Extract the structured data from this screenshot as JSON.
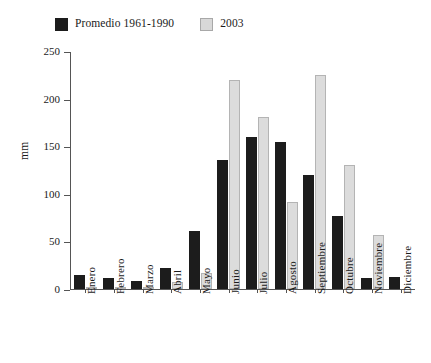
{
  "chart_data": {
    "type": "bar",
    "title": "",
    "xlabel": "",
    "ylabel": "mm",
    "ylim": [
      0,
      250
    ],
    "yticks": [
      0,
      50,
      100,
      150,
      200,
      250
    ],
    "grid": false,
    "legend_position": "top-left",
    "categories": [
      "Enero",
      "Febrero",
      "Marzo",
      "Abril",
      "Mayo",
      "Junio",
      "Julio",
      "Agosto",
      "Septiembre",
      "Octubre",
      "Noviembre",
      "Diciembre"
    ],
    "series": [
      {
        "name": "Promedio 1961-1990",
        "color": "#1c1c1c",
        "values": [
          15,
          12,
          8,
          22,
          61,
          136,
          160,
          155,
          120,
          77,
          12,
          13
        ]
      },
      {
        "name": "2003",
        "color": "#dcdcdc",
        "values": [
          2,
          1,
          1,
          7,
          17,
          220,
          181,
          92,
          226,
          131,
          57,
          0
        ]
      }
    ]
  },
  "legend": {
    "entries": [
      {
        "label": "Promedio 1961-1990"
      },
      {
        "label": "2003"
      }
    ]
  },
  "axes": {
    "y_title": "mm",
    "y_tick_labels": [
      "250",
      "200",
      "150",
      "100",
      "50",
      "0"
    ]
  },
  "colors": {
    "series_0": "#1c1c1c",
    "series_1": "#dcdcdc",
    "axis": "#555555",
    "background": "#ffffff"
  }
}
